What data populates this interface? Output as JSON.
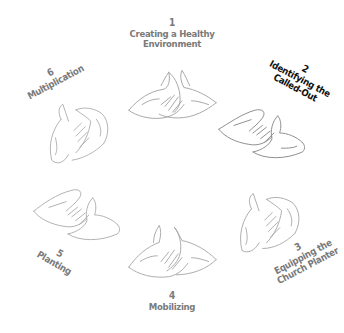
{
  "diagram": {
    "type": "cycle",
    "background": "#ffffff",
    "colors": {
      "label_default": "#7a7a7a",
      "label_active": "#111111",
      "sketch_stroke": "#9a9a9a"
    },
    "active_step": 2,
    "steps": [
      {
        "number": "1",
        "lines": [
          "Creating a Healthy",
          "Environment"
        ],
        "icon": "cupped-hands-icon"
      },
      {
        "number": "2",
        "lines": [
          "Identifying the",
          "Called-Out"
        ],
        "icon": "cupped-hands-icon"
      },
      {
        "number": "3",
        "lines": [
          "Equipping the",
          "Church Planter"
        ],
        "icon": "cupped-hands-icon"
      },
      {
        "number": "4",
        "lines": [
          "Mobilizing"
        ],
        "icon": "cupped-hands-icon"
      },
      {
        "number": "5",
        "lines": [
          "Planting"
        ],
        "icon": "cupped-hands-icon"
      },
      {
        "number": "6",
        "lines": [
          "Multiplication"
        ],
        "icon": "cupped-hands-icon"
      }
    ]
  }
}
